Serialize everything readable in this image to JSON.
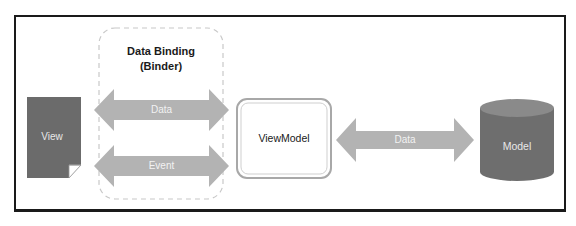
{
  "diagram": {
    "title_line1": "Data Binding",
    "title_line2": "(Binder)",
    "nodes": {
      "view": {
        "label": "View",
        "color": "#6b6b6b"
      },
      "viewmodel": {
        "label": "ViewModel",
        "color": "#ffffff"
      },
      "model": {
        "label": "Model",
        "color": "#6e6e6e"
      }
    },
    "arrows": {
      "binder_data": {
        "label": "Data",
        "color": "#b3b3b3"
      },
      "binder_event": {
        "label": "Event",
        "color": "#b3b3b3"
      },
      "model_data": {
        "label": "Data",
        "color": "#b3b3b3"
      }
    },
    "colors": {
      "frame": "#1a1a1a",
      "dashed_box": "#c8c8c8",
      "text_dark": "#1a1a1a",
      "text_light": "#e8e8e8"
    }
  }
}
